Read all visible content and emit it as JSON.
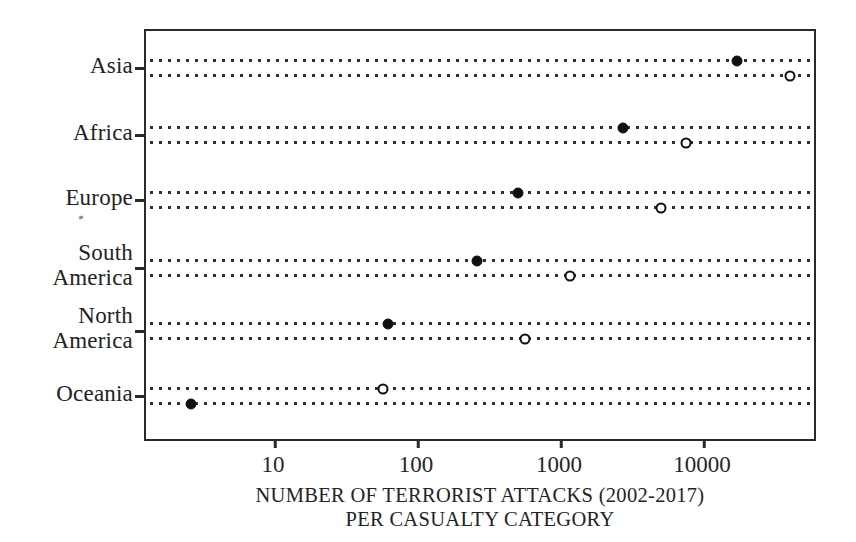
{
  "chart_data": {
    "type": "scatter",
    "subtype": "dot-plot",
    "title": "",
    "xlabel": "NUMBER OF TERRORIST ATTACKS (2002-2017) PER CASUALTY CATEGORY",
    "xlabel_lines": [
      "NUMBER OF TERRORIST ATTACKS (2002-2017)",
      "PER CASUALTY CATEGORY"
    ],
    "ylabel": "",
    "xscale": "log",
    "xlim": [
      2,
      60000
    ],
    "xticks": [
      10,
      100,
      1000,
      10000
    ],
    "xtick_labels": [
      "10",
      "100",
      "1000",
      "10000"
    ],
    "grid": false,
    "legend": "none",
    "categories": [
      "Asia",
      "Africa",
      "Europe",
      "South America",
      "North America",
      "Oceania"
    ],
    "series": [
      {
        "name": "filled",
        "marker": "filled-circle",
        "color": "#101010",
        "values": [
          17000,
          2700,
          500,
          260,
          62,
          2.6
        ]
      },
      {
        "name": "open",
        "marker": "open-circle",
        "color": "#101010",
        "values": [
          40000,
          7500,
          5000,
          1150,
          560,
          57
        ]
      }
    ],
    "rows": [
      {
        "category": "Asia",
        "label_lines": [
          "Asia"
        ],
        "top_marker": {
          "style": "filled",
          "value": 17000
        },
        "bottom_marker": {
          "style": "open",
          "value": 40000
        }
      },
      {
        "category": "Africa",
        "label_lines": [
          "Africa"
        ],
        "top_marker": {
          "style": "filled",
          "value": 2700
        },
        "bottom_marker": {
          "style": "open",
          "value": 7500
        }
      },
      {
        "category": "Europe",
        "label_lines": [
          "Europe"
        ],
        "top_marker": {
          "style": "filled",
          "value": 500
        },
        "bottom_marker": {
          "style": "open",
          "value": 5000
        }
      },
      {
        "category": "South America",
        "label_lines": [
          "South",
          "America"
        ],
        "top_marker": {
          "style": "filled",
          "value": 260
        },
        "bottom_marker": {
          "style": "open",
          "value": 1150
        }
      },
      {
        "category": "North America",
        "label_lines": [
          "North",
          "America"
        ],
        "top_marker": {
          "style": "filled",
          "value": 62
        },
        "bottom_marker": {
          "style": "open",
          "value": 560
        }
      },
      {
        "category": "Oceania",
        "label_lines": [
          "Oceania"
        ],
        "top_marker": {
          "style": "open",
          "value": 57
        },
        "bottom_marker": {
          "style": "filled",
          "value": 2.6
        }
      }
    ]
  },
  "axis": {
    "tick_labels": [
      "10",
      "100",
      "1000",
      "10000"
    ],
    "title_line1": "NUMBER OF TERRORIST ATTACKS (2002-2017)",
    "title_line2": "PER CASUALTY CATEGORY"
  },
  "categories": [
    {
      "line1": "Asia",
      "line2": ""
    },
    {
      "line1": "Africa",
      "line2": ""
    },
    {
      "line1": "Europe",
      "line2": ""
    },
    {
      "line1": "South",
      "line2": "America"
    },
    {
      "line1": "North",
      "line2": "America"
    },
    {
      "line1": "Oceania",
      "line2": ""
    }
  ],
  "colors": {
    "axis": "#2a2a2a",
    "marker": "#101010",
    "dotted_line": "#2f2f2f",
    "text": "#222222",
    "background": "#ffffff"
  }
}
